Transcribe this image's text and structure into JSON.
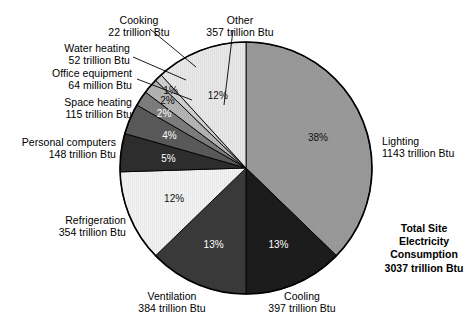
{
  "chart_data": {
    "type": "pie",
    "title": "",
    "subtitle": "",
    "xlabel": "",
    "ylabel": "",
    "legend_position": "callout-labels",
    "grid": false,
    "total": {
      "line1": "Total Site",
      "line2": "Electricity",
      "line3": "Consumption",
      "line4": "3037 trillion Btu",
      "value": 3037,
      "units": "trillion Btu"
    },
    "categories": [
      "Lighting",
      "Cooling",
      "Ventilation",
      "Refrigeration",
      "Personal computers",
      "Space heating",
      "Office equipment",
      "Water heating",
      "Cooking",
      "Other"
    ],
    "values": [
      1143,
      397,
      384,
      354,
      148,
      115,
      64,
      52,
      22,
      357
    ],
    "percentages": [
      38,
      13,
      13,
      12,
      5,
      4,
      2,
      2,
      1,
      12
    ],
    "units": [
      "trillion Btu",
      "trillion Btu",
      "trillion Btu",
      "trillion Btu",
      "trillion Btu",
      "trillion Btu",
      "million Btu",
      "trillion Btu",
      "trillion Btu",
      "trillion Btu"
    ],
    "colors": [
      "#9a9a9a",
      "#1c1c1c",
      "#3a3a3a",
      "#f2f2f2",
      "#2e2e2e",
      "#5a5a5a",
      "#7d7d7d",
      "#b4b4b4",
      "#d0d0d0",
      "#e8e8e8"
    ],
    "slices": [
      {
        "name": "Lighting",
        "value_label": "1143 trillion Btu",
        "pct_label": "38%",
        "value": 1143,
        "percent": 38,
        "color": "#9a9a9a",
        "pct_text_color": "#111111"
      },
      {
        "name": "Cooling",
        "value_label": "397 trillion Btu",
        "pct_label": "13%",
        "value": 397,
        "percent": 13,
        "color": "#1c1c1c",
        "pct_text_color": "#ffffff"
      },
      {
        "name": "Ventilation",
        "value_label": "384 trillion Btu",
        "pct_label": "13%",
        "value": 384,
        "percent": 13,
        "color": "#3a3a3a",
        "pct_text_color": "#ffffff"
      },
      {
        "name": "Refrigeration",
        "value_label": "354 trillion Btu",
        "pct_label": "12%",
        "value": 354,
        "percent": 12,
        "color": "#f2f2f2",
        "pct_text_color": "#111111"
      },
      {
        "name": "Personal computers",
        "value_label": "148 trillion Btu",
        "pct_label": "5%",
        "value": 148,
        "percent": 5,
        "color": "#2e2e2e",
        "pct_text_color": "#ffffff"
      },
      {
        "name": "Space heating",
        "value_label": "115 trillion Btu",
        "pct_label": "4%",
        "value": 115,
        "percent": 4,
        "color": "#5a5a5a",
        "pct_text_color": "#ffffff"
      },
      {
        "name": "Office equipment",
        "value_label": "64 million Btu",
        "pct_label": "2%",
        "value": 64,
        "percent": 2,
        "color": "#7d7d7d",
        "pct_text_color": "#ffffff"
      },
      {
        "name": "Water heating",
        "value_label": "52 trillion Btu",
        "pct_label": "2%",
        "value": 52,
        "percent": 2,
        "color": "#b4b4b4",
        "pct_text_color": "#111111"
      },
      {
        "name": "Cooking",
        "value_label": "22 trillion Btu",
        "pct_label": "1%",
        "value": 22,
        "percent": 1,
        "color": "#d0d0d0",
        "pct_text_color": "#111111"
      },
      {
        "name": "Other",
        "value_label": "357 trillion Btu",
        "pct_label": "12%",
        "value": 357,
        "percent": 12,
        "color": "#e8e8e8",
        "pct_text_color": "#111111"
      }
    ]
  },
  "callouts": {
    "cooking": {
      "line1": "Cooking",
      "line2": "22 trillion Btu"
    },
    "other": {
      "line1": "Other",
      "line2": "357 trillion Btu"
    },
    "water_heating": {
      "line1": "Water heating",
      "line2": "52 trillion Btu"
    },
    "office_equipment": {
      "line1": "Office equipment",
      "line2": "64 million Btu"
    },
    "space_heating": {
      "line1": "Space heating",
      "line2": "115 trillion Btu"
    },
    "personal_computers": {
      "line1": "Personal computers",
      "line2": "148 trillion Btu"
    },
    "refrigeration": {
      "line1": "Refrigeration",
      "line2": "354 trillion Btu"
    },
    "ventilation": {
      "line1": "Ventilation",
      "line2": "384 trillion Btu"
    },
    "cooling": {
      "line1": "Cooling",
      "line2": "397 trillion Btu"
    },
    "lighting": {
      "line1": "Lighting",
      "line2": "1143 trillion Btu"
    }
  }
}
